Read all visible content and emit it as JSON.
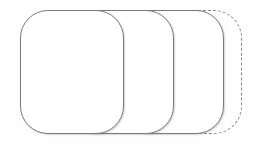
{
  "canvas": {
    "width": 262,
    "height": 148,
    "background_color": "#fefefe"
  },
  "diagram": {
    "type": "overlapping-rounded-card-stack",
    "card_count": 4,
    "solid_border_color": "#7a7a7a",
    "dashed_border_color": "#8a8a8a",
    "label_color": "#1a1a1a",
    "cards": [
      {
        "index": 1,
        "label": "",
        "border_style": "solid",
        "filled": true
      },
      {
        "index": 2,
        "label": "",
        "border_style": "solid",
        "filled": true
      },
      {
        "index": 3,
        "label": "",
        "border_style": "solid",
        "filled": true
      },
      {
        "index": 4,
        "label": "Ask",
        "border_style": "dashed",
        "filled": false,
        "label_rotation": "-90deg"
      }
    ]
  }
}
